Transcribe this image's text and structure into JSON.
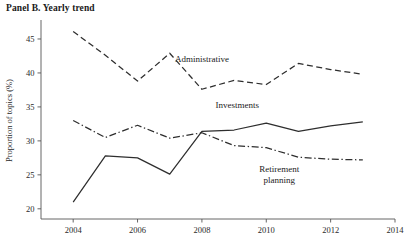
{
  "panel": {
    "title": "Panel B. Yearly trend"
  },
  "chart_data": {
    "type": "line",
    "title": "Panel B. Yearly trend",
    "xlabel": "",
    "ylabel": "Proportion of topics (%)",
    "xlim": [
      2003,
      2014
    ],
    "ylim": [
      18.5,
      47.5
    ],
    "grid": false,
    "legend": "inline-labels",
    "xticks": [
      "2004",
      "2006",
      "2008",
      "2010",
      "2012",
      "2014"
    ],
    "xtick_values": [
      2004,
      2006,
      2008,
      2010,
      2012,
      2014
    ],
    "yticks": [
      "20",
      "25",
      "30",
      "35",
      "40",
      "45"
    ],
    "ytick_values": [
      20,
      25,
      30,
      35,
      40,
      45
    ],
    "x": [
      2004,
      2005,
      2006,
      2007,
      2008,
      2009,
      2010,
      2011,
      2012,
      2013
    ],
    "series": [
      {
        "name": "Administrative",
        "style": "dashed",
        "label_x": 2008.0,
        "label_y": 41.6,
        "values": [
          46.1,
          42.6,
          38.8,
          42.9,
          37.6,
          38.9,
          38.3,
          41.4,
          40.5,
          39.8
        ]
      },
      {
        "name": "Investments",
        "style": "solid",
        "label_x": 2009.1,
        "label_y": 34.9,
        "values": [
          21.0,
          27.8,
          27.5,
          25.1,
          31.4,
          31.6,
          32.6,
          31.4,
          32.2,
          32.8
        ]
      },
      {
        "name": "Retirement planning",
        "style": "dashdot",
        "label_line_1": "Retirement",
        "label_line_2": "planning",
        "label_x": 2010.4,
        "label_y": 25.4,
        "values": [
          33.0,
          30.5,
          32.3,
          30.4,
          31.2,
          29.3,
          29.0,
          27.6,
          27.3,
          27.2
        ]
      }
    ]
  }
}
